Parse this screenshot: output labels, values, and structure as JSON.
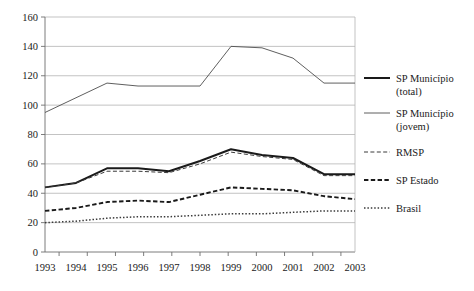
{
  "chart_data": {
    "type": "line",
    "title": "",
    "xlabel": "",
    "ylabel": "",
    "categories": [
      "1993",
      "1994",
      "1995",
      "1996",
      "1997",
      "1998",
      "1999",
      "2000",
      "2001",
      "2002",
      "2003"
    ],
    "ylim": [
      0,
      160
    ],
    "yticks": [
      0,
      20,
      40,
      60,
      80,
      100,
      120,
      140,
      160
    ],
    "grid": "horizontal",
    "legend_position": "right",
    "series": [
      {
        "name": "SP Município (total)",
        "style": "solid-thick",
        "color": "#1a1a1a",
        "values": [
          44,
          47,
          57,
          57,
          55,
          62,
          70,
          66,
          64,
          53,
          53
        ]
      },
      {
        "name": "SP Município (jovem)",
        "style": "solid-thin",
        "color": "#4d4d4d",
        "values": [
          95,
          105,
          115,
          113,
          113,
          113,
          140,
          139,
          132,
          115,
          115
        ]
      },
      {
        "name": "RMSP",
        "style": "dash-fine",
        "color": "#3a3a3a",
        "values": [
          44,
          47,
          55,
          55,
          54,
          60,
          68,
          65,
          63,
          52,
          52
        ]
      },
      {
        "name": "SP Estado",
        "style": "dash-bold",
        "color": "#1a1a1a",
        "values": [
          28,
          30,
          34,
          35,
          34,
          39,
          44,
          43,
          42,
          38,
          36
        ]
      },
      {
        "name": "Brasil",
        "style": "dotted",
        "color": "#3a3a3a",
        "values": [
          20,
          21,
          23,
          24,
          24,
          25,
          26,
          26,
          27,
          28,
          28
        ]
      }
    ]
  },
  "legend": {
    "entries": [
      {
        "line1": "SP Município",
        "line2": "(total)"
      },
      {
        "line1": "SP Município",
        "line2": "(jovem)"
      },
      {
        "line1": "RMSP",
        "line2": ""
      },
      {
        "line1": "SP Estado",
        "line2": ""
      },
      {
        "line1": "Brasil",
        "line2": ""
      }
    ]
  }
}
